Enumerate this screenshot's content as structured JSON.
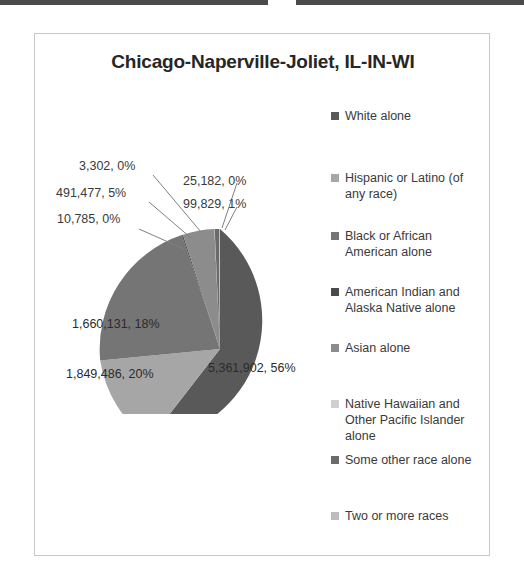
{
  "chart": {
    "title": "Chicago-Naperville-Joliet, IL-IN-WI",
    "frame_border_color": "#c8c8c8",
    "background": "#ffffff"
  },
  "legend": {
    "position": "right",
    "items": [
      {
        "label": "White alone",
        "color": "#595959",
        "top": 0
      },
      {
        "label": "Hispanic or Latino (of any race)",
        "color": "#a6a6a6",
        "top": 62
      },
      {
        "label": "Black or African American alone",
        "color": "#757575",
        "top": 120
      },
      {
        "label": "American Indian and Alaska Native alone",
        "color": "#4a4a4a",
        "top": 176
      },
      {
        "label": "Asian alone",
        "color": "#8c8c8c",
        "top": 232
      },
      {
        "label": "Native Hawaiian and Other Pacific Islander alone",
        "color": "#cfcfcf",
        "top": 288
      },
      {
        "label": "Some other race alone",
        "color": "#6b6b6b",
        "top": 344
      },
      {
        "label": "Two or more races",
        "color": "#bdbdbd",
        "top": 400
      }
    ]
  },
  "callouts": {
    "native_hawaiian": "3,302, 0%",
    "asian": "491,477, 5%",
    "two_or_more": "10,785, 0%",
    "american_indian": "25,182, 0%",
    "some_other": "99,829, 1%"
  },
  "slice_labels": {
    "white": "5,361,902, 56%",
    "hispanic": "1,849,486, 20%",
    "black": "1,660,131, 18%"
  },
  "chart_data": {
    "type": "pie",
    "title": "Chicago-Naperville-Joliet, IL-IN-WI",
    "xlabel": "",
    "ylabel": "",
    "legend_position": "right",
    "grid": false,
    "total": 9498094,
    "labels": [
      "White alone",
      "Hispanic or Latino (of any race)",
      "Black or African American alone",
      "American Indian and Alaska Native alone",
      "Asian alone",
      "Native Hawaiian and Other Pacific Islander alone",
      "Some other race alone",
      "Two or more races"
    ],
    "values": [
      5361902,
      1849486,
      1660131,
      25182,
      491477,
      3302,
      99829,
      10785
    ],
    "percents": [
      56,
      20,
      18,
      0,
      5,
      0,
      1,
      0
    ],
    "colors": [
      "#595959",
      "#a6a6a6",
      "#757575",
      "#4a4a4a",
      "#8c8c8c",
      "#cfcfcf",
      "#6b6b6b",
      "#bdbdbd"
    ],
    "data_labels": [
      "5,361,902, 56%",
      "1,849,486, 20%",
      "1,660,131, 18%",
      "25,182, 0%",
      "491,477, 5%",
      "3,302, 0%",
      "99,829, 1%",
      "10,785, 0%"
    ]
  }
}
